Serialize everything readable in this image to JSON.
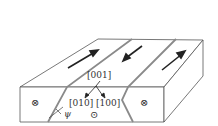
{
  "figure": {
    "type": "magnetic-domain-slab",
    "labels": {
      "axis_001": "[001]",
      "axis_010": "[010]",
      "axis_100": "[100]",
      "angle": "ψ"
    },
    "symbols": {
      "into_page_left": "⊗",
      "into_page_right": "⊗",
      "out_of_page": "⊙"
    },
    "domains": [
      {
        "position": "left",
        "arrow_direction": "up-right"
      },
      {
        "position": "middle",
        "arrow_direction": "down-left"
      },
      {
        "position": "right",
        "arrow_direction": "up-right"
      }
    ],
    "colors": {
      "outline": "#555555",
      "domain_wall": "#888888",
      "arrow": "#222222"
    }
  }
}
